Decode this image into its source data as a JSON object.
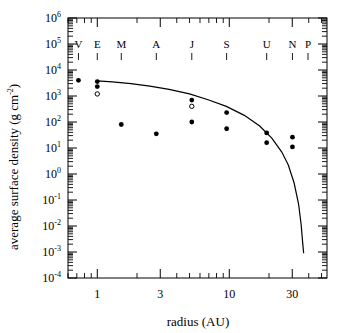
{
  "chart_data": {
    "type": "scatter",
    "title": "",
    "xlabel": "radius (AU)",
    "ylabel": "average surface density (g cm⁻²)",
    "xscale": "log",
    "yscale": "log",
    "xlim": [
      0.6,
      55
    ],
    "ylim": [
      0.0001,
      1000000
    ],
    "grid": false,
    "legend": null,
    "xticks_major": [
      1,
      3,
      10,
      30
    ],
    "xtick_labels": [
      "1",
      "3",
      "10",
      "30"
    ],
    "yticks_major": [
      0.0001,
      0.001,
      0.01,
      0.1,
      1,
      10,
      100,
      1000,
      10000,
      100000,
      1000000
    ],
    "ytick_labels": [
      "10−4",
      "10−3",
      "10−2",
      "10−1",
      "10⁰",
      "10¹",
      "10²",
      "10³",
      "10⁴",
      "10⁵",
      "10⁶"
    ],
    "ytick_mantissas": [
      "-4",
      "-3",
      "-2",
      "-1",
      "0",
      "1",
      "2",
      "3",
      "4",
      "5",
      "6"
    ],
    "planet_markers": [
      {
        "label": "V",
        "radius_au": 0.72
      },
      {
        "label": "E",
        "radius_au": 1.0
      },
      {
        "label": "M",
        "radius_au": 1.52
      },
      {
        "label": "A",
        "radius_au": 2.8
      },
      {
        "label": "J",
        "radius_au": 5.2
      },
      {
        "label": "S",
        "radius_au": 9.55
      },
      {
        "label": "U",
        "radius_au": 19.2
      },
      {
        "label": "N",
        "radius_au": 30.1
      },
      {
        "label": "P",
        "radius_au": 39.5
      }
    ],
    "series": [
      {
        "name": "filled-points",
        "marker": "filled-circle",
        "points": [
          {
            "x": 0.72,
            "y": 4000
          },
          {
            "x": 1.0,
            "y": 3600
          },
          {
            "x": 1.0,
            "y": 2300
          },
          {
            "x": 1.52,
            "y": 80
          },
          {
            "x": 2.8,
            "y": 35
          },
          {
            "x": 5.2,
            "y": 700
          },
          {
            "x": 5.2,
            "y": 100
          },
          {
            "x": 9.55,
            "y": 230
          },
          {
            "x": 9.55,
            "y": 55
          },
          {
            "x": 19.2,
            "y": 38
          },
          {
            "x": 19.2,
            "y": 16
          },
          {
            "x": 30.1,
            "y": 26
          },
          {
            "x": 30.1,
            "y": 11
          }
        ]
      },
      {
        "name": "open-points",
        "marker": "open-circle",
        "points": [
          {
            "x": 1.0,
            "y": 1200
          },
          {
            "x": 5.2,
            "y": 400
          }
        ]
      }
    ],
    "curve": {
      "name": "model-curve",
      "style": "solid-line",
      "points": [
        {
          "x": 1.0,
          "y": 3800
        },
        {
          "x": 1.3,
          "y": 3500
        },
        {
          "x": 1.8,
          "y": 3000
        },
        {
          "x": 2.5,
          "y": 2400
        },
        {
          "x": 3.5,
          "y": 1800
        },
        {
          "x": 5.0,
          "y": 1200
        },
        {
          "x": 7.0,
          "y": 700
        },
        {
          "x": 9.5,
          "y": 400
        },
        {
          "x": 13.0,
          "y": 180
        },
        {
          "x": 17.0,
          "y": 70
        },
        {
          "x": 21.0,
          "y": 24
        },
        {
          "x": 25.0,
          "y": 7
        },
        {
          "x": 28.0,
          "y": 2.2
        },
        {
          "x": 31.0,
          "y": 0.45
        },
        {
          "x": 33.5,
          "y": 0.07
        },
        {
          "x": 35.0,
          "y": 0.012
        },
        {
          "x": 36.0,
          "y": 0.0022
        },
        {
          "x": 36.6,
          "y": 0.0009
        }
      ]
    }
  },
  "axes": {
    "xlabel": "radius (AU)",
    "ylabel_line": "average surface density (g cm",
    "ylabel_exp": "-2",
    "ylabel_close": ")"
  }
}
